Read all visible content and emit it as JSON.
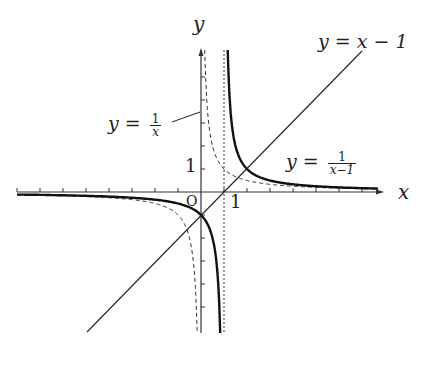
{
  "diagram": {
    "type": "function-graph",
    "axes": {
      "x_label": "x",
      "y_label": "y",
      "origin_label": "O",
      "x_tick_label": "1",
      "y_tick_label": "1",
      "x_ticks": [
        -8,
        -7,
        -6,
        -5,
        -4,
        -3,
        -2,
        -1,
        1,
        2,
        3,
        4,
        5,
        6,
        7
      ],
      "y_ticks": [
        -5,
        -4,
        -3,
        -2,
        -1,
        1,
        2,
        3,
        4,
        5
      ]
    },
    "curves": [
      {
        "id": "reciprocal",
        "expr": "y = 1/x",
        "style": "dashed"
      },
      {
        "id": "shifted-reciprocal",
        "expr": "y = 1/(x-1)",
        "style": "solid-bold"
      },
      {
        "id": "line",
        "expr": "y = x - 1",
        "style": "solid-thin"
      },
      {
        "id": "asymptote",
        "expr": "x = 1",
        "style": "dotted"
      }
    ],
    "labels": {
      "line": {
        "lhs": "y",
        "eq": "=",
        "rhs": "x − 1"
      },
      "reciprocal": {
        "lhs": "y",
        "eq": "=",
        "num": "1",
        "den": "x"
      },
      "shifted": {
        "lhs": "y",
        "eq": "=",
        "num": "1",
        "den": "x−1"
      }
    },
    "colors": {
      "ink": "#222222",
      "background": "#ffffff"
    }
  }
}
